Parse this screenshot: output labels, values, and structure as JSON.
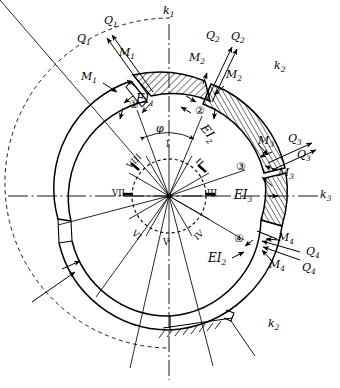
{
  "figure": {
    "background": "#ffffff",
    "ink": "#000000",
    "width": 340,
    "height": 388
  },
  "axes": [
    {
      "name": "k1",
      "label": "k",
      "sub": "1",
      "orientation": "vertical",
      "x": 167,
      "y": 12
    },
    {
      "name": "k3",
      "label": "k",
      "sub": "3",
      "orientation": "horizontal",
      "x": 322,
      "y": 197
    },
    {
      "name": "k2-upper",
      "label": "k",
      "sub": "2",
      "orientation": "free",
      "x": 277,
      "y": 66
    },
    {
      "name": "k2-lower",
      "label": "k",
      "sub": "2",
      "orientation": "free",
      "x": 271,
      "y": 324
    }
  ],
  "stiffness": [
    {
      "name": "EI1",
      "label": "EI",
      "sub": "1",
      "x": 141,
      "y": 99
    },
    {
      "name": "EI2-upper",
      "label": "EI",
      "sub": "2",
      "x": 215,
      "y": 129
    },
    {
      "name": "EI3",
      "label": "EI",
      "sub": "3",
      "x": 240,
      "y": 195
    },
    {
      "name": "EI2-lower",
      "label": "EI",
      "sub": "2",
      "x": 215,
      "y": 258
    }
  ],
  "angle_marker": {
    "name": "phi",
    "label": "φ",
    "x": 160,
    "y": 129
  },
  "joints": [
    {
      "id": 1,
      "marker": "①",
      "x": 135,
      "y": 104
    },
    {
      "id": 2,
      "marker": "②",
      "x": 201,
      "y": 110
    },
    {
      "id": 3,
      "marker": "③",
      "x": 242,
      "y": 166
    },
    {
      "id": 4,
      "marker": "④",
      "x": 240,
      "y": 238
    }
  ],
  "forces": [
    {
      "name": "Q1-outer",
      "label": "Q",
      "sub": "1",
      "x": 107,
      "y": 22
    },
    {
      "name": "Q1-inner",
      "label": "Q",
      "sub": "1",
      "x": 80,
      "y": 39
    },
    {
      "name": "M1-inner",
      "label": "M",
      "sub": "1",
      "x": 122,
      "y": 53
    },
    {
      "name": "M1-outer",
      "label": "M",
      "sub": "1",
      "x": 84,
      "y": 77
    },
    {
      "name": "Q2-inner",
      "label": "Q",
      "sub": "2",
      "x": 209,
      "y": 36
    },
    {
      "name": "Q2-outer",
      "label": "Q",
      "sub": "2",
      "x": 234,
      "y": 37
    },
    {
      "name": "M2-inner",
      "label": "M",
      "sub": "2",
      "x": 192,
      "y": 58
    },
    {
      "name": "M2-outer",
      "label": "M",
      "sub": "2",
      "x": 229,
      "y": 75
    },
    {
      "name": "M3-upper",
      "label": "M",
      "sub": "3",
      "x": 261,
      "y": 141
    },
    {
      "name": "Q3-upper",
      "label": "Q",
      "sub": "3",
      "x": 291,
      "y": 139
    },
    {
      "name": "Q3-lower",
      "label": "Q",
      "sub": "3",
      "x": 300,
      "y": 155
    },
    {
      "name": "M3-lower",
      "label": "M",
      "sub": "3",
      "x": 281,
      "y": 173
    },
    {
      "name": "M4-upper",
      "label": "M",
      "sub": "4",
      "x": 281,
      "y": 238
    },
    {
      "name": "Q4-upper",
      "label": "Q",
      "sub": "4",
      "x": 309,
      "y": 252
    },
    {
      "name": "Q4-lower",
      "label": "Q",
      "sub": "4",
      "x": 305,
      "y": 268
    },
    {
      "name": "M4-lower",
      "label": "M",
      "sub": "4",
      "x": 272,
      "y": 265
    }
  ],
  "hub": {
    "center_x": 169,
    "center_y": 196,
    "radius": 37,
    "segments": 12,
    "roman_numerals": [
      {
        "name": "I",
        "text": "I",
        "x": 167,
        "y": 145
      },
      {
        "name": "II",
        "text": "II",
        "x": 199,
        "y": 163
      },
      {
        "name": "III",
        "text": "III",
        "x": 212,
        "y": 193
      },
      {
        "name": "IV",
        "text": "IV",
        "x": 197,
        "y": 236
      },
      {
        "name": "V",
        "text": "V",
        "x": 165,
        "y": 243
      },
      {
        "name": "VI",
        "text": "VI",
        "x": 136,
        "y": 236
      },
      {
        "name": "VII",
        "text": "VII",
        "x": 119,
        "y": 193
      },
      {
        "name": "VIII",
        "text": "VIII",
        "x": 131,
        "y": 162
      }
    ]
  },
  "support": {
    "name": "ground-hatching",
    "description": "fixed support hatching at arch base"
  }
}
